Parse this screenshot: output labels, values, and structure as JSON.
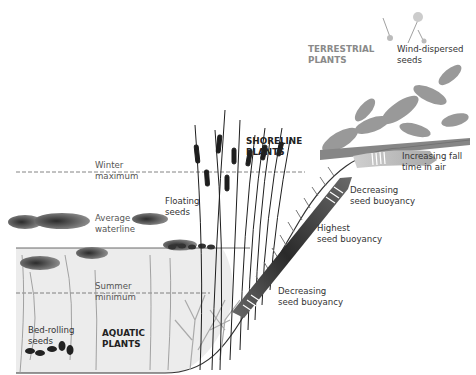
{
  "diagram": {
    "zones": {
      "aquatic": {
        "label_line1": "AQUATIC",
        "label_line2": "PLANTS"
      },
      "shoreline": {
        "label_line1": "SHORELINE",
        "label_line2": "PLANTS"
      },
      "terrestrial": {
        "label_line1": "TERRESTRIAL",
        "label_line2": "PLANTS"
      }
    },
    "water_levels": {
      "winter": {
        "line1": "Winter",
        "line2": "maximum"
      },
      "average": {
        "line1": "Average",
        "line2": "waterline"
      },
      "summer": {
        "line1": "Summer",
        "line2": "minimum"
      }
    },
    "seed_types": {
      "floating": {
        "line1": "Floating",
        "line2": "seeds"
      },
      "bed_rolling": {
        "line1": "Bed-rolling",
        "line2": "seeds"
      },
      "wind_dispersed": {
        "line1": "Wind-dispersed",
        "line2": "seeds"
      }
    },
    "gradient_labels": {
      "decreasing_lower": {
        "line1": "Decreasing",
        "line2": "seed buoyancy"
      },
      "highest": {
        "line1": "Highest",
        "line2": "seed buoyancy"
      },
      "decreasing_upper": {
        "line1": "Decreasing",
        "line2": "seed buoyancy"
      },
      "fall_time": {
        "line1": "Increasing fall",
        "line2": "time in air"
      }
    },
    "icons": {
      "lily_pad": "lily-pad-icon",
      "cattail": "cattail-icon",
      "dandelion_seed": "dandelion-seed-icon",
      "seed": "seed-icon",
      "buoyancy_arrow": "buoyancy-arrow-icon",
      "fall_time_arrow": "fall-time-arrow-icon"
    },
    "colors": {
      "water": "#ececec",
      "bank_line": "#333333",
      "arrow_dark": "#3a3a3a",
      "arrow_light": "#b5b5b5",
      "terrestrial_foliage": "#8f8f8f",
      "shoreline_reeds": "#1e1e1e",
      "label_text": "#333333"
    }
  }
}
